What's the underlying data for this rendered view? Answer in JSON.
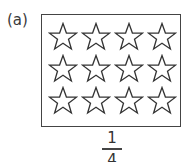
{
  "label": "(a)",
  "stars": {
    "rows": 3,
    "cols": 4,
    "count": 12,
    "icon": "star-outline-icon"
  },
  "fraction": {
    "numerator": "1",
    "denominator": "4"
  }
}
